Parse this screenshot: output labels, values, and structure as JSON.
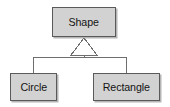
{
  "diagram": {
    "type": "uml-class-inheritance",
    "colors": {
      "box_fill": "#d2d2d2",
      "box_border": "#5a5a5a",
      "text": "#141414",
      "line": "#6e6e6e",
      "arrowhead_fill": "#ffffff",
      "background": "#ffffff"
    },
    "parent": {
      "name": "Shape",
      "x": 52,
      "y": 7,
      "width": 64,
      "height": 30
    },
    "children": [
      {
        "name": "Circle",
        "x": 10,
        "y": 73,
        "width": 47,
        "height": 28
      },
      {
        "name": "Rectangle",
        "x": 93,
        "y": 73,
        "width": 67,
        "height": 28
      }
    ],
    "relationship": {
      "kind": "generalization",
      "arrowhead": "hollow-triangle",
      "arrowhead_points": "84,38 97,55 71,55",
      "stem": {
        "x": 84,
        "y1": 55,
        "y2": 57
      },
      "crossbar": {
        "y": 57,
        "x1": 33,
        "x2": 127
      },
      "drops": [
        {
          "x": 33,
          "y1": 57,
          "y2": 73
        },
        {
          "x": 127,
          "y1": 57,
          "y2": 73
        }
      ]
    }
  }
}
